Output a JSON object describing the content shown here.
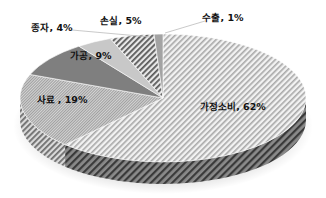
{
  "chart_data": {
    "type": "pie",
    "style": "3d",
    "title": "",
    "categories": [
      "가정소비",
      "사료",
      "가공",
      "종자",
      "손실",
      "수출"
    ],
    "values": [
      62,
      19,
      9,
      4,
      5,
      1
    ],
    "labels": [
      "가정소비, 62%",
      "사료 , 19%",
      "가공, 9%",
      "종자, 4%",
      "손실, 5%",
      "수출, 1%"
    ],
    "unit": "%",
    "legend": "none",
    "start_angle_deg": 0,
    "direction": "clockwise",
    "colors": [
      "#e6e6e6",
      "#bdbdbd",
      "#7d7d7d",
      "#c9c9c9",
      "#9a9a9a",
      "#a0a0a0"
    ]
  }
}
